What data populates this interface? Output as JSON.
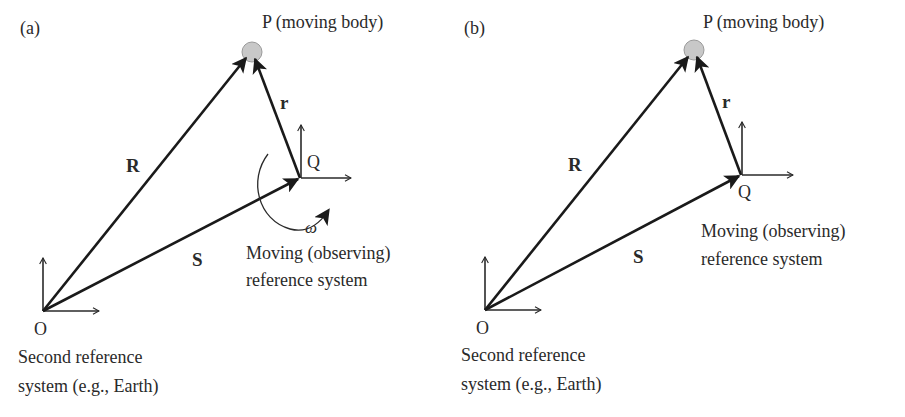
{
  "figure": {
    "colors": {
      "background": "#ffffff",
      "ink": "#1a1a1a",
      "body_fill": "#c8c8c8",
      "body_stroke": "#9a9a9a"
    },
    "panels": [
      {
        "id": "a",
        "panel_label": "(a)",
        "body_label": "P (moving body)",
        "vector_R_label": "R",
        "vector_r_label": "r",
        "vector_S_label": "S",
        "point_Q_label": "Q",
        "point_O_label": "O",
        "rotation_label": "ω",
        "moving_system_label_line1": "Moving (observing)",
        "moving_system_label_line2": "reference system",
        "second_system_label_line1": "Second reference",
        "second_system_label_line2": "system (e.g., Earth)",
        "rotating": true
      },
      {
        "id": "b",
        "panel_label": "(b)",
        "body_label": "P (moving body)",
        "vector_R_label": "R",
        "vector_r_label": "r",
        "vector_S_label": "S",
        "point_Q_label": "Q",
        "point_O_label": "O",
        "moving_system_label_line1": "Moving (observing)",
        "moving_system_label_line2": "reference system",
        "second_system_label_line1": "Second reference",
        "second_system_label_line2": "system (e.g., Earth)",
        "rotating": false
      }
    ]
  }
}
